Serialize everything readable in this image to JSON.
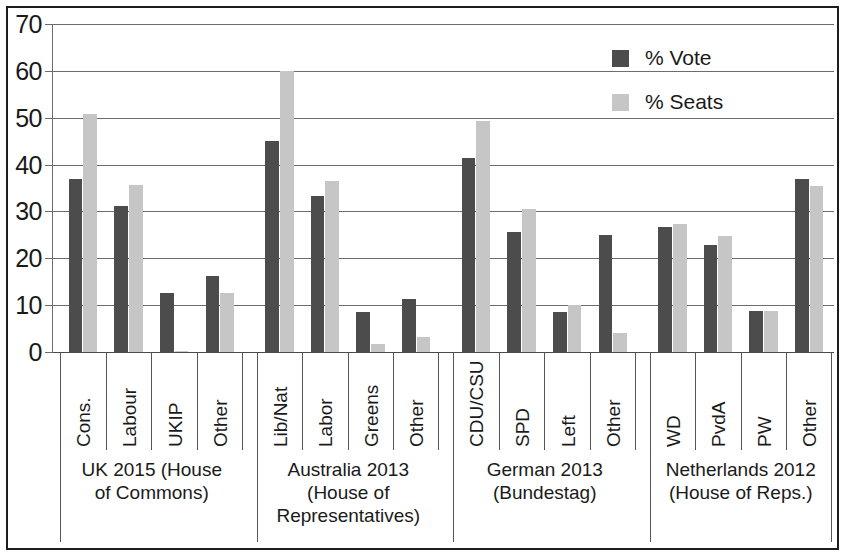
{
  "chart_data": {
    "type": "bar",
    "title": "",
    "subtitle": "",
    "xlabel": "",
    "ylabel": "",
    "ylim": [
      0,
      70
    ],
    "yticks": [
      0,
      10,
      20,
      30,
      40,
      50,
      60,
      70
    ],
    "ytick_labels": [
      "0",
      "10",
      "20",
      "30",
      "40",
      "50",
      "60",
      "70"
    ],
    "grid": true,
    "legend_position": "top-right",
    "legend": [
      "% Vote",
      "% Seats"
    ],
    "categories": [
      "Cons.",
      "Labour",
      "UKIP",
      "Other",
      "Lib/Nat",
      "Labor",
      "Greens",
      "Other",
      "CDU/CSU",
      "SPD",
      "Left",
      "Other",
      "WD",
      "PvdA",
      "PW",
      "Other"
    ],
    "series": [
      {
        "name": "% Vote",
        "color": "#4c4c4c",
        "values": [
          36.9,
          31.2,
          12.6,
          16.3,
          45.0,
          33.4,
          8.6,
          11.3,
          41.5,
          25.7,
          8.6,
          25.0,
          26.6,
          22.8,
          8.8,
          37.0
        ]
      },
      {
        "name": "% Seats",
        "color": "#c6c6c6",
        "values": [
          50.9,
          35.7,
          0.2,
          12.6,
          59.9,
          36.4,
          1.7,
          3.3,
          49.3,
          30.6,
          10.1,
          4.0,
          27.3,
          24.8,
          8.7,
          35.5
        ]
      }
    ],
    "groups": [
      {
        "label": "UK 2015 (House\nof Commons)",
        "categories": [
          "Cons.",
          "Labour",
          "UKIP",
          "Other"
        ]
      },
      {
        "label": "Australia 2013\n(House of\nRepresentatives)",
        "categories": [
          "Lib/Nat",
          "Labor",
          "Greens",
          "Other"
        ]
      },
      {
        "label": "German 2013\n(Bundestag)",
        "categories": [
          "CDU/CSU",
          "SPD",
          "Left",
          "Other"
        ]
      },
      {
        "label": "Netherlands 2012\n(House of Reps.)",
        "categories": [
          "WD",
          "PvdA",
          "PW",
          "Other"
        ]
      }
    ]
  },
  "colors": {
    "vote": "#4c4c4c",
    "seats": "#c6c6c6",
    "grid": "#6d6d6d",
    "frame": "#1d1d1d",
    "text": "#1a1a1a"
  }
}
